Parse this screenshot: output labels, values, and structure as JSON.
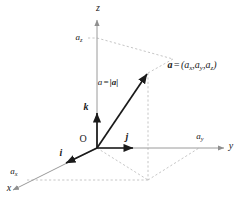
{
  "figure": {
    "background_color": "#ffffff",
    "axis_color": "#9a9a9a",
    "vector_color": "#1a1a1a",
    "dashed_color": "#b4b4b4",
    "text_color": "#1a1a1a"
  },
  "axes": {
    "z": {
      "label": "z",
      "tick_label": "a",
      "tick_sub": "z"
    },
    "y": {
      "label": "y",
      "tick_label": "a",
      "tick_sub": "y"
    },
    "x": {
      "label": "x",
      "tick_label": "a",
      "tick_sub": "x"
    }
  },
  "origin": {
    "label": "O"
  },
  "unit_vectors": {
    "i": "i",
    "j": "j",
    "k": "k"
  },
  "vector": {
    "name": "a",
    "magnitude_label_lhs": "a",
    "magnitude_label_equals": "=",
    "magnitude_label_rhs": "|a|",
    "components_equals": "=",
    "components_open": "(",
    "components": [
      {
        "base": "a",
        "sub": "x"
      },
      {
        "base": "a",
        "sub": "y"
      },
      {
        "base": "a",
        "sub": "z"
      }
    ],
    "components_sep": ",",
    "components_close": ")"
  }
}
